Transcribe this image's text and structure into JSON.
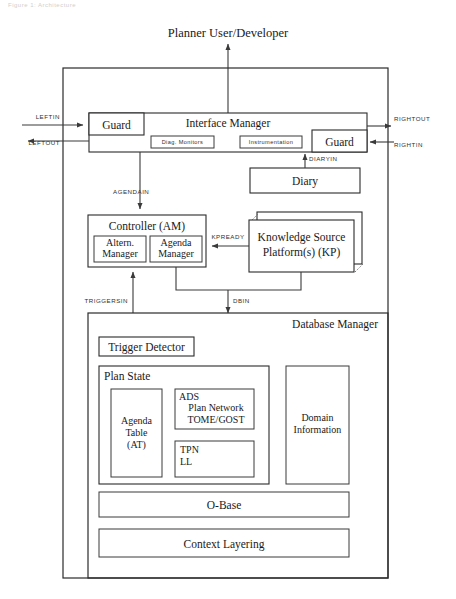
{
  "figure": {
    "top_caption": "Figure 1: Architecture",
    "actor_label": "Planner User/Developer"
  },
  "interface_layer": {
    "interface_manager": "Interface Manager",
    "guard_left": "Guard",
    "guard_right": "Guard",
    "diag_monitors": "Diag. Monitors",
    "instrumentation": "Instrumentation",
    "diary": "Diary"
  },
  "control_layer": {
    "controller": "Controller (AM)",
    "altern_manager_line1": "Altern.",
    "altern_manager_line2": "Manager",
    "agenda_manager_line1": "Agenda",
    "agenda_manager_line2": "Manager",
    "kp_line1": "Knowledge Source",
    "kp_line2": "Platform(s) (KP)"
  },
  "database_layer": {
    "database_manager": "Database Manager",
    "trigger_detector": "Trigger Detector",
    "plan_state": "Plan State",
    "agenda_table_line1": "Agenda",
    "agenda_table_line2": "Table",
    "agenda_table_line3": "(AT)",
    "ads_label": "ADS",
    "ads_line2": "Plan Network",
    "ads_line3": "TOME/GOST",
    "tpn_line1": "TPN",
    "tpn_line2": "LL",
    "domain_line1": "Domain",
    "domain_line2": "Information",
    "obase": "O-Base",
    "context_layering": "Context Layering"
  },
  "connections": {
    "leftin": "LEFTIN",
    "leftout": "LEFTOUT",
    "rightout": "RIGHTOUT",
    "rightin": "RIGHTIN",
    "diaryin": "DIARYIN",
    "agendain": "AGENDAIN",
    "kpready": "KPREADY",
    "triggersin": "TRIGGERSIN",
    "dbin": "DBIN"
  },
  "colors": {
    "ink": "#1a1a1a",
    "line": "#3a3a3a",
    "paper": "#ffffff"
  }
}
